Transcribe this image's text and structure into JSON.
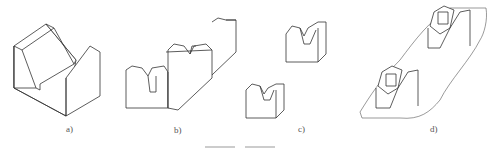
{
  "figure": {
    "panels": [
      {
        "id": "a",
        "label": "a)",
        "description": "single V-block"
      },
      {
        "id": "b",
        "label": "b)",
        "description": "long double V-block on common base"
      },
      {
        "id": "c",
        "label": "c)",
        "description": "pair of separate small V-blocks"
      },
      {
        "id": "d",
        "label": "d)",
        "description": "two V-blocks supporting a shaft/workpiece"
      }
    ],
    "colors": {
      "line": "#333333",
      "background": "#ffffff",
      "label": "#555555"
    }
  }
}
